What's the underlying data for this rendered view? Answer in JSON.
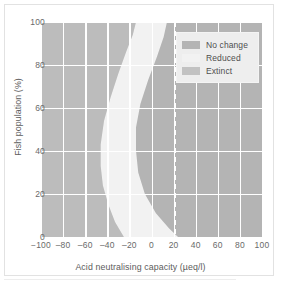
{
  "chart_data": {
    "type": "area",
    "title": "",
    "xlabel": "Acid neutralising capacity (µeq/l)",
    "ylabel": "Fish population (%)",
    "xlim": [
      -100,
      100
    ],
    "ylim": [
      0,
      100
    ],
    "grid": true,
    "xticks": [
      "−100",
      "‒80",
      "‒60",
      "‒40",
      "‒20",
      "0",
      "20",
      "40",
      "60",
      "80",
      "100"
    ],
    "xtick_values": [
      -100,
      -80,
      -60,
      -40,
      -20,
      0,
      20,
      40,
      60,
      80,
      100
    ],
    "yticks": [
      "0",
      "20",
      "40",
      "60",
      "80",
      "100"
    ],
    "ytick_values": [
      0,
      20,
      40,
      60,
      80,
      100
    ],
    "legend_position": "top-right",
    "series": [
      {
        "name": "No change",
        "color": "#b4b4b4",
        "description": "Region to the right of the upper boundary curve; fish populations unaffected."
      },
      {
        "name": "Reduced",
        "color": "#f2f2f2",
        "description": "Transition band between the two boundary curves; fish populations reduced."
      },
      {
        "name": "Extinct",
        "color": "#bcbcbc",
        "description": "Region to the left of the lower boundary curve; fish populations extinct."
      }
    ],
    "boundary_extinct_reduced": {
      "comment": "Left edge of the Reduced band: fish population (%) vs acid neutralising capacity (µeq/l)",
      "y_percent": [
        100,
        94,
        86,
        76,
        65,
        54,
        43,
        33,
        24,
        15,
        7,
        0
      ],
      "x_aneq": [
        -14,
        -17,
        -23,
        -30,
        -37,
        -43,
        -46,
        -46,
        -44,
        -39,
        -33,
        -25
      ]
    },
    "boundary_reduced_nochange": {
      "comment": "Right edge of the Reduced band: fish population (%) vs acid neutralising capacity (µeq/l)",
      "y_percent": [
        100,
        93,
        84,
        73,
        62,
        51,
        40,
        30,
        20,
        11,
        4,
        0
      ],
      "x_aneq": [
        14,
        11,
        5,
        -3,
        -10,
        -14,
        -14,
        -12,
        -6,
        4,
        16,
        24
      ]
    },
    "threshold_line": {
      "x_aneq": 20,
      "style": "dashed",
      "color": "#ffffff",
      "label": ""
    }
  },
  "legend": {
    "items": [
      {
        "label": "No change",
        "swatch": "#b4b4b4"
      },
      {
        "label": "Reduced",
        "swatch": "#f2f2f2"
      },
      {
        "label": "Extinct",
        "swatch": "#c2c2c2"
      }
    ]
  },
  "axes": {
    "x_label": "Acid neutralising capacity (µeq/l)",
    "y_label": "Fish population (%)"
  }
}
